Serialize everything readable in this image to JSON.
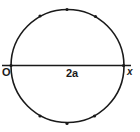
{
  "diagram": {
    "labels": {
      "origin": "O",
      "diameter": "2a",
      "axis": "x"
    },
    "colors": {
      "stroke": "#1a1a1a",
      "background": "#ffffff"
    },
    "circle": {
      "cx": 67.5,
      "cy": 66,
      "r": 56.5
    },
    "axis_line": {
      "x1": 2,
      "y1": 65.5,
      "x2": 131,
      "y2": 65.5
    },
    "points": [
      {
        "name": "left",
        "x": 11,
        "y": 65.5
      },
      {
        "name": "right",
        "x": 123.5,
        "y": 65.5
      },
      {
        "name": "top",
        "x": 67,
        "y": 9.5
      },
      {
        "name": "upper-left",
        "x": 40,
        "y": 16
      },
      {
        "name": "upper-right",
        "x": 95.5,
        "y": 16.5
      },
      {
        "name": "bottom",
        "x": 67,
        "y": 123.5
      },
      {
        "name": "lower-left",
        "x": 40,
        "y": 116
      },
      {
        "name": "lower-right",
        "x": 94.5,
        "y": 116
      }
    ]
  }
}
